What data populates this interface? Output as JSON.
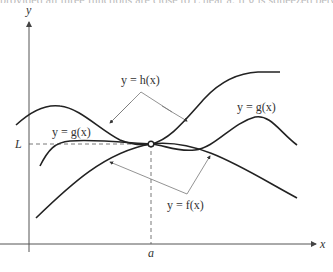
{
  "caption_fragment": "provided all three functions are close to L near a; if g is squeezed between f and h",
  "axes": {
    "x_label": "x",
    "y_label": "y",
    "L_label": "L",
    "a_label": "a"
  },
  "curves": {
    "h": {
      "label": "y = h(x)"
    },
    "g_left": {
      "label": "y = g(x)"
    },
    "g_right": {
      "label": "y = g(x)"
    },
    "f": {
      "label": "y = f(x)"
    }
  },
  "colors": {
    "curve": "#222222",
    "axis": "#555555",
    "leader": "#777777",
    "dashed": "#555555"
  }
}
